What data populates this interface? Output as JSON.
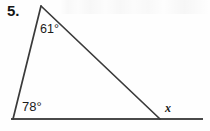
{
  "problem": {
    "number_label": "5.",
    "figure_type": "triangle-with-exterior-angle"
  },
  "figure": {
    "name": "triangle-diagram",
    "background_color": "#fefefe",
    "stroke_color": "#3a3a3a",
    "baseline_color": "#4a4a4a",
    "vertices": {
      "apex": {
        "x": 41,
        "y": 6
      },
      "bottom_left": {
        "x": 13,
        "y": 119
      },
      "bottom_right": {
        "x": 160,
        "y": 119
      }
    },
    "baseline": {
      "x1": 11,
      "y1": 119,
      "x2": 203,
      "y2": 119
    },
    "labels": {
      "apex_angle": "61°",
      "base_left_angle": "78°",
      "exterior_angle": "x"
    }
  }
}
